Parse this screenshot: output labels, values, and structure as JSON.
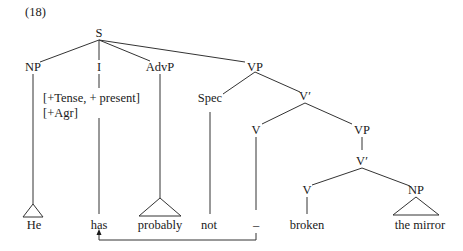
{
  "example_number": "(18)",
  "nodes": {
    "S": "S",
    "NP_subject": "NP",
    "I": "I",
    "AdvP": "AdvP",
    "VP_top": "VP",
    "Spec": "Spec",
    "Vbar_top": "V′",
    "V_top": "V",
    "VP_lower": "VP",
    "Vbar_lower": "V′",
    "V_lower": "V",
    "NP_object": "NP"
  },
  "features": {
    "line1": "[+Tense, + present]",
    "line2": "[+Agr]"
  },
  "leaves": {
    "he": "He",
    "has": "has",
    "probably": "probably",
    "not": "not",
    "trace": "–",
    "broken": "broken",
    "the_mirror": "the mirror"
  },
  "movement_arrow": {
    "from": "–",
    "to": "has"
  }
}
